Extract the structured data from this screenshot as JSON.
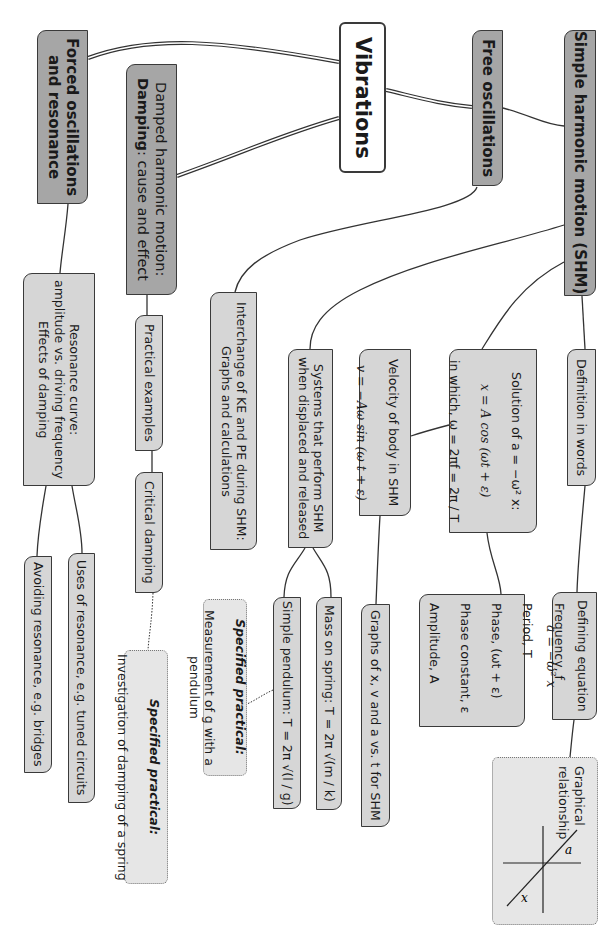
{
  "diagram": {
    "orientation": "rotated 90 degrees clockwise",
    "root": {
      "label": "Vibrations"
    },
    "branches": [
      {
        "id": "free",
        "label": "Free oscillations",
        "children": [
          {
            "id": "shm",
            "label": "Simple harmonic motion (SHM)"
          },
          {
            "id": "interchange",
            "label": "Interchange of KE and PE during SHM:\nGraphs and calculations"
          }
        ]
      },
      {
        "id": "damped",
        "label_line1": "Damped harmonic motion:",
        "label_bold": "Damping",
        "label_rest": ": cause and effect"
      },
      {
        "id": "forced",
        "label": "Forced oscillations\nand resonance"
      }
    ],
    "shm_children": {
      "definition": "Definition in words",
      "defining_equation": {
        "title": "Defining equation",
        "equation": "a = −ω² x"
      },
      "graphical": {
        "title": "Graphical\nrelationship",
        "axis_y": "a",
        "axis_x": "x"
      },
      "solution": {
        "line1": "Solution of a = −ω² x:",
        "line2": "x = A cos (ωt + ε)",
        "line3": "in which, ω = 2πf = 2π / T"
      },
      "terms": [
        "Frequency, f",
        "Period, T",
        "Phase, (ωt + ε)",
        "Phase constant, ε",
        "Amplitude, A"
      ],
      "velocity": {
        "line1": "Velocity of body in SHM",
        "line2": "v = −Aω sin (ω t + ε)"
      },
      "graphs": "Graphs of x, v and a vs. t for SHM",
      "systems": "Systems that perform SHM\nwhen displaced and released",
      "mass_spring": "Mass on spring: T = 2π √(m / k)",
      "pendulum": "Simple pendulum: T = 2π √(l / g)",
      "practical_g": {
        "title": "Specified practical:",
        "text": "Measurement of g with a pendulum"
      }
    },
    "damped_children": {
      "practical_examples": "Practical examples",
      "critical": "Critical damping",
      "practical_spring": {
        "title": "Specified practical:",
        "text": "Investigation of damping of a spring"
      }
    },
    "forced_children": {
      "resonance_curve": "Resonance curve:\namplitude vs. driving frequency\nEffects of damping",
      "uses": "Uses of resonance, e.g. tuned circuits",
      "avoiding": "Avoiding resonance, e.g. bridges"
    },
    "colors": {
      "dark_node": "#a6a6a6",
      "light_node": "#d6d6d6",
      "practical_node": "#e6e6e6",
      "border": "#3a3a3a"
    }
  }
}
